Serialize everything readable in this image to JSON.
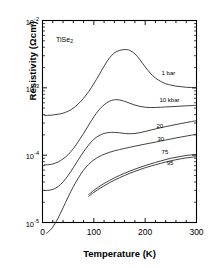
{
  "chart_data": {
    "type": "line",
    "title": "",
    "sample_label": "TiSe2",
    "sample_label_base": "TiSe",
    "sample_label_sub": "2",
    "xlabel": "Temperature (K)",
    "ylabel": "Resistivity (Ωcm)",
    "xlim": [
      0,
      300
    ],
    "ylim": [
      1e-05,
      0.01
    ],
    "yscale": "log",
    "xscale": "linear",
    "grid": false,
    "legend_position": "inline-right",
    "xticks": [
      0,
      100,
      200,
      300
    ],
    "xtick_labels": [
      "0",
      "100",
      "200",
      "300"
    ],
    "xminor_step": 20,
    "yticks": [
      1e-05,
      0.0001,
      0.001,
      0.01
    ],
    "ytick_labels": [
      "10-5",
      "10-4",
      "10-3",
      "10-2"
    ],
    "ytick_exponents": [
      "-5",
      "-4",
      "-3",
      "-2"
    ],
    "ytick_mantissa": "10",
    "series": [
      {
        "name": "1 bar",
        "label": "1 bar",
        "label_x": 232,
        "label_y": 0.00165,
        "x": [
          4,
          10,
          20,
          30,
          40,
          50,
          60,
          70,
          80,
          90,
          100,
          110,
          120,
          130,
          140,
          150,
          160,
          165,
          170,
          180,
          190,
          200,
          210,
          220,
          230,
          240,
          250,
          260,
          270,
          280,
          290,
          300
        ],
        "y": [
          0.00039,
          0.00039,
          0.000395,
          0.000405,
          0.00042,
          0.00045,
          0.0005,
          0.00058,
          0.0007,
          0.00088,
          0.00115,
          0.00155,
          0.0021,
          0.00275,
          0.0033,
          0.0036,
          0.0037,
          0.00368,
          0.0036,
          0.0032,
          0.0026,
          0.00205,
          0.00165,
          0.0014,
          0.00125,
          0.00115,
          0.0011,
          0.00106,
          0.00104,
          0.00102,
          0.00101,
          0.001
        ]
      },
      {
        "name": "10 kbar",
        "label": "10 kbar",
        "label_x": 228,
        "label_y": 0.00066,
        "x": [
          4,
          10,
          20,
          30,
          40,
          50,
          60,
          70,
          80,
          90,
          100,
          110,
          120,
          130,
          140,
          150,
          160,
          170,
          180,
          190,
          200,
          210,
          220,
          230,
          240,
          250,
          260,
          270,
          280,
          290,
          300
        ],
        "y": [
          7.2e-05,
          7.2e-05,
          7.4e-05,
          7.9e-05,
          8.8e-05,
          0.000102,
          0.000125,
          0.00016,
          0.00021,
          0.00028,
          0.00037,
          0.00047,
          0.00056,
          0.00063,
          0.000665,
          0.00066,
          0.00063,
          0.00059,
          0.000555,
          0.00053,
          0.000515,
          0.00051,
          0.00051,
          0.000515,
          0.00052,
          0.000525,
          0.00053,
          0.000535,
          0.00054,
          0.000545,
          0.00055
        ]
      },
      {
        "name": "20 kbar",
        "label": "20",
        "label_x": 222,
        "label_y": 0.000275,
        "x": [
          4,
          10,
          20,
          30,
          40,
          50,
          60,
          70,
          80,
          90,
          100,
          110,
          120,
          130,
          140,
          150,
          160,
          170,
          180,
          190,
          200,
          210,
          220,
          230,
          240,
          250,
          260,
          270,
          280,
          290,
          300
        ],
        "y": [
          3e-05,
          3e-05,
          3.1e-05,
          3.4e-05,
          4e-05,
          5e-05,
          6.5e-05,
          8.6e-05,
          0.000112,
          0.000142,
          0.000172,
          0.000195,
          0.00021,
          0.000217,
          0.000218,
          0.000215,
          0.00021,
          0.000208,
          0.00021,
          0.000216,
          0.000225,
          0.000235,
          0.000245,
          0.000255,
          0.000265,
          0.000275,
          0.000285,
          0.000295,
          0.000305,
          0.000315,
          0.000325
        ]
      },
      {
        "name": "30 kbar",
        "label": "30",
        "label_x": 224,
        "label_y": 0.000172,
        "x": [
          8,
          12,
          20,
          30,
          40,
          50,
          60,
          70,
          80,
          90,
          100,
          110,
          120,
          130,
          140,
          150,
          160,
          170,
          180,
          190,
          200,
          210,
          220,
          230,
          240,
          250,
          260,
          270,
          280,
          290,
          300
        ],
        "y": [
          7e-06,
          7.3e-06,
          8.6e-06,
          1.15e-05,
          1.65e-05,
          2.4e-05,
          3.4e-05,
          4.6e-05,
          6e-05,
          7.3e-05,
          8.5e-05,
          9.5e-05,
          0.000103,
          0.00011,
          0.000116,
          0.000121,
          0.000126,
          0.000131,
          0.000136,
          0.000141,
          0.000146,
          0.000151,
          0.000156,
          0.000162,
          0.000168,
          0.000174,
          0.00018,
          0.000186,
          0.000192,
          0.000198,
          0.000205
        ]
      },
      {
        "name": "75 kbar",
        "label": "75",
        "label_x": 232,
        "label_y": 0.000112,
        "x": [
          90,
          100,
          110,
          120,
          130,
          140,
          150,
          160,
          170,
          180,
          190,
          200,
          210,
          220,
          230,
          240,
          250,
          260,
          270,
          280,
          290,
          300
        ],
        "y": [
          2.6e-05,
          3e-05,
          3.4e-05,
          3.8e-05,
          4.2e-05,
          4.6e-05,
          5e-05,
          5.4e-05,
          5.8e-05,
          6.2e-05,
          6.6e-05,
          7e-05,
          7.4e-05,
          7.8e-05,
          8.2e-05,
          8.6e-05,
          9e-05,
          9.3e-05,
          9.6e-05,
          9.9e-05,
          0.000101,
          0.000103
        ]
      },
      {
        "name": "95 kbar",
        "label": "95",
        "label_x": 242,
        "label_y": 7.6e-05,
        "x": [
          90,
          100,
          110,
          120,
          130,
          140,
          150,
          160,
          170,
          180,
          190,
          200,
          210,
          220,
          230,
          240,
          250,
          260,
          270,
          280,
          290,
          300
        ],
        "y": [
          2.45e-05,
          2.8e-05,
          3.15e-05,
          3.5e-05,
          3.88e-05,
          4.25e-05,
          4.62e-05,
          5e-05,
          5.38e-05,
          5.75e-05,
          6.12e-05,
          6.5e-05,
          6.85e-05,
          7.2e-05,
          7.55e-05,
          7.9e-05,
          8.25e-05,
          8.55e-05,
          8.85e-05,
          9.1e-05,
          9.3e-05,
          9.5e-05
        ]
      }
    ]
  }
}
